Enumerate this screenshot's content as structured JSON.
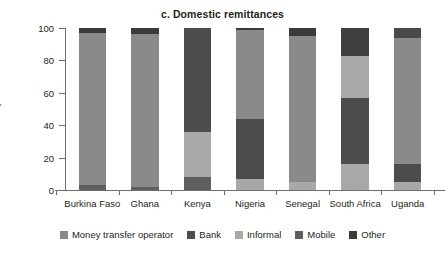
{
  "chart_data": {
    "type": "bar",
    "stacked": true,
    "title": "c. Domestic remittances",
    "xlabel": "",
    "ylabel": "percent",
    "ylim": [
      0,
      100
    ],
    "yticks": [
      0,
      20,
      40,
      60,
      80,
      100
    ],
    "grid": false,
    "legend_position": "bottom",
    "categories": [
      "Burkina Faso",
      "Ghana",
      "Kenya",
      "Nigeria",
      "Senegal",
      "South Africa",
      "Uganda"
    ],
    "series": [
      {
        "name": "Money transfer operator",
        "color": "#8a8a8a",
        "values": [
          94,
          94,
          0,
          55,
          90,
          0,
          78
        ]
      },
      {
        "name": "Bank",
        "color": "#4d4d4d",
        "values": [
          0,
          0,
          64,
          37,
          0,
          41,
          11
        ]
      },
      {
        "name": "Informal",
        "color": "#a8a8a8",
        "values": [
          0,
          0,
          28,
          7,
          5,
          42,
          5
        ]
      },
      {
        "name": "Mobile",
        "color": "#5e5e5e",
        "values": [
          3,
          2,
          8,
          0,
          0,
          17,
          6
        ]
      },
      {
        "name": "Other",
        "color": "#3a3a3a",
        "values": [
          3,
          4,
          0,
          1,
          5,
          0,
          0
        ]
      }
    ],
    "stacks": [
      {
        "category": "Burkina Faso",
        "segments": [
          {
            "series": "Mobile",
            "from": 0,
            "to": 3,
            "color": "#5e5e5e"
          },
          {
            "series": "Money transfer operator",
            "from": 3,
            "to": 97,
            "color": "#8a8a8a"
          },
          {
            "series": "Other",
            "from": 97,
            "to": 100,
            "color": "#3a3a3a"
          }
        ]
      },
      {
        "category": "Ghana",
        "segments": [
          {
            "series": "Mobile",
            "from": 0,
            "to": 2,
            "color": "#5e5e5e"
          },
          {
            "series": "Money transfer operator",
            "from": 2,
            "to": 96,
            "color": "#8a8a8a"
          },
          {
            "series": "Other",
            "from": 96,
            "to": 100,
            "color": "#3a3a3a"
          }
        ]
      },
      {
        "category": "Kenya",
        "segments": [
          {
            "series": "Mobile",
            "from": 0,
            "to": 8,
            "color": "#5e5e5e"
          },
          {
            "series": "Informal",
            "from": 8,
            "to": 36,
            "color": "#a8a8a8"
          },
          {
            "series": "Bank",
            "from": 36,
            "to": 100,
            "color": "#4d4d4d"
          }
        ]
      },
      {
        "category": "Nigeria",
        "segments": [
          {
            "series": "Informal",
            "from": 0,
            "to": 7,
            "color": "#a8a8a8"
          },
          {
            "series": "Bank",
            "from": 7,
            "to": 44,
            "color": "#4d4d4d"
          },
          {
            "series": "Money transfer operator",
            "from": 44,
            "to": 99,
            "color": "#8a8a8a"
          },
          {
            "series": "Other",
            "from": 99,
            "to": 100,
            "color": "#3a3a3a"
          }
        ]
      },
      {
        "category": "Senegal",
        "segments": [
          {
            "series": "Informal",
            "from": 0,
            "to": 5,
            "color": "#a8a8a8"
          },
          {
            "series": "Money transfer operator",
            "from": 5,
            "to": 95,
            "color": "#8a8a8a"
          },
          {
            "series": "Other",
            "from": 95,
            "to": 100,
            "color": "#3a3a3a"
          }
        ]
      },
      {
        "category": "South Africa",
        "segments": [
          {
            "series": "Informal",
            "from": 0,
            "to": 16,
            "color": "#a8a8a8"
          },
          {
            "series": "Bank",
            "from": 16,
            "to": 57,
            "color": "#4d4d4d"
          },
          {
            "series": "Informal",
            "from": 57,
            "to": 83,
            "color": "#a8a8a8"
          },
          {
            "series": "Mobile",
            "from": 83,
            "to": 100,
            "color": "#3f3f3f"
          }
        ]
      },
      {
        "category": "Uganda",
        "segments": [
          {
            "series": "Informal",
            "from": 0,
            "to": 5,
            "color": "#a8a8a8"
          },
          {
            "series": "Bank",
            "from": 5,
            "to": 16,
            "color": "#4d4d4d"
          },
          {
            "series": "Money transfer operator",
            "from": 16,
            "to": 94,
            "color": "#8a8a8a"
          },
          {
            "series": "Mobile",
            "from": 94,
            "to": 100,
            "color": "#4a4a4a"
          }
        ]
      }
    ],
    "legend": [
      {
        "label": "Money transfer operator",
        "color": "#8a8a8a"
      },
      {
        "label": "Bank",
        "color": "#4d4d4d"
      },
      {
        "label": "Informal",
        "color": "#a8a8a8"
      },
      {
        "label": "Mobile",
        "color": "#5e5e5e"
      },
      {
        "label": "Other",
        "color": "#3a3a3a"
      }
    ]
  }
}
